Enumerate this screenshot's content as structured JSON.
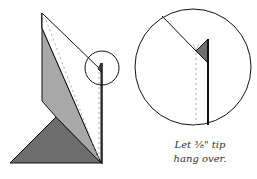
{
  "figure": {
    "caption_line1": "Let ⅜\" tip",
    "caption_line2": "hang over.",
    "colors": {
      "dark_fill": "#6e6e6e",
      "medium_fill": "#a8a8a8",
      "light_fill": "#ffffff",
      "stroke": "#111111",
      "dashed": "#aaaaaa"
    }
  }
}
